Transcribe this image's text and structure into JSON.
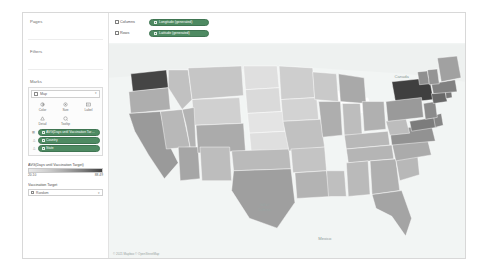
{
  "sidebar": {
    "pages": {
      "title": "Pages"
    },
    "filters": {
      "title": "Filters"
    },
    "marks": {
      "title": "Marks",
      "mark_type": {
        "value": "Map",
        "icon": "map-mark-icon",
        "caret": "▾"
      },
      "buttons": [
        {
          "label": "Color",
          "icon": "color-icon"
        },
        {
          "label": "Size",
          "icon": "size-icon"
        },
        {
          "label": "Label",
          "icon": "label-icon"
        },
        {
          "label": "Detail",
          "icon": "detail-icon"
        },
        {
          "label": "Tooltip",
          "icon": "tooltip-icon"
        }
      ],
      "pills": [
        {
          "prefix": "▤",
          "label": "AVG(Days until Vaccination Target)",
          "icon": "measure-icon"
        },
        {
          "prefix": "△",
          "label": "Country",
          "icon": "dimension-icon"
        },
        {
          "prefix": "△",
          "label": "State",
          "icon": "dimension-icon"
        }
      ]
    },
    "color_legend": {
      "title": "AVG(Days until Vaccination Target)",
      "min": "20.10",
      "max": "88.49"
    },
    "size_legend": {
      "title": "Vaccination Target",
      "value": "Random",
      "icon": "size-legend-icon",
      "caret": "▾"
    }
  },
  "shelves": [
    {
      "name": "Columns",
      "icon": "columns-icon",
      "pill": {
        "label": "Longitude (generated)",
        "icon": "measure-icon"
      }
    },
    {
      "name": "Rows",
      "icon": "rows-icon",
      "pill": {
        "label": "Latitude (generated)",
        "icon": "measure-icon"
      }
    }
  ],
  "map": {
    "attribution": "© 2021 Mapbox © OpenStreetMap",
    "labels": [
      {
        "text": "Canada",
        "x": 352,
        "y": 42,
        "size": "big"
      },
      {
        "text": "Mexico",
        "x": 258,
        "y": 242,
        "size": "big"
      },
      {
        "text": "Gulf of",
        "x": 186,
        "y": 200,
        "size": "small"
      },
      {
        "text": "California",
        "x": 184,
        "y": 206,
        "size": "small"
      }
    ]
  },
  "chart_data": {
    "type": "map",
    "title": "AVG(Days until Vaccination Target)",
    "measure": "Days until Vaccination Target",
    "aggregation": "AVG",
    "color_scale": {
      "min": 20.1,
      "max": 88.49,
      "ramp": [
        "#e9e9e9",
        "#3f3f3f"
      ]
    },
    "regions": [
      {
        "state": "WA",
        "value": 86.0
      },
      {
        "state": "NY",
        "value": 88.5
      },
      {
        "state": "OR",
        "value": 44.0
      },
      {
        "state": "CA",
        "value": 52.0
      },
      {
        "state": "NV",
        "value": 40.0
      },
      {
        "state": "ID",
        "value": 36.0
      },
      {
        "state": "MT",
        "value": 34.0
      },
      {
        "state": "WY",
        "value": 30.0
      },
      {
        "state": "UT",
        "value": 42.0
      },
      {
        "state": "AZ",
        "value": 47.0
      },
      {
        "state": "CO",
        "value": 45.0
      },
      {
        "state": "NM",
        "value": 38.0
      },
      {
        "state": "ND",
        "value": 24.0
      },
      {
        "state": "SD",
        "value": 26.0
      },
      {
        "state": "NE",
        "value": 22.0
      },
      {
        "state": "KS",
        "value": 24.0
      },
      {
        "state": "OK",
        "value": 39.0
      },
      {
        "state": "TX",
        "value": 50.0
      },
      {
        "state": "MN",
        "value": 31.0
      },
      {
        "state": "IA",
        "value": 29.0
      },
      {
        "state": "MO",
        "value": 36.0
      },
      {
        "state": "AR",
        "value": 35.0
      },
      {
        "state": "LA",
        "value": 42.0
      },
      {
        "state": "WI",
        "value": 33.0
      },
      {
        "state": "IL",
        "value": 44.0
      },
      {
        "state": "MS",
        "value": 37.0
      },
      {
        "state": "MI",
        "value": 46.0
      },
      {
        "state": "IN",
        "value": 38.0
      },
      {
        "state": "OH",
        "value": 43.0
      },
      {
        "state": "KY",
        "value": 40.0
      },
      {
        "state": "TN",
        "value": 41.0
      },
      {
        "state": "AL",
        "value": 39.0
      },
      {
        "state": "GA",
        "value": 43.0
      },
      {
        "state": "FL",
        "value": 48.0
      },
      {
        "state": "SC",
        "value": 40.0
      },
      {
        "state": "NC",
        "value": 45.0
      },
      {
        "state": "VA",
        "value": 55.0
      },
      {
        "state": "WV",
        "value": 38.0
      },
      {
        "state": "PA",
        "value": 52.0
      },
      {
        "state": "MD",
        "value": 64.0
      },
      {
        "state": "DE",
        "value": 60.0
      },
      {
        "state": "NJ",
        "value": 58.0
      },
      {
        "state": "CT",
        "value": 72.0
      },
      {
        "state": "RI",
        "value": 66.0
      },
      {
        "state": "MA",
        "value": 62.0
      },
      {
        "state": "VT",
        "value": 56.0
      },
      {
        "state": "NH",
        "value": 54.0
      },
      {
        "state": "ME",
        "value": 49.0
      }
    ]
  }
}
